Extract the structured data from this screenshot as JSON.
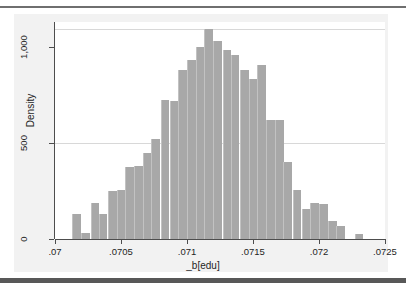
{
  "chart_data": {
    "type": "bar",
    "title": "",
    "subtitle": "",
    "xlabel": "_b[edu]",
    "ylabel": "Density",
    "grid": true,
    "legend": null,
    "xlim": [
      0.07,
      0.0725
    ],
    "ylim": [
      0,
      1130
    ],
    "xticks": [
      ".07",
      ".0705",
      ".071",
      ".0715",
      ".072",
      ".0725"
    ],
    "xtick_values": [
      0.07,
      0.0705,
      0.071,
      0.0715,
      0.072,
      0.0725
    ],
    "yticks": [
      "0",
      "500",
      "1,000"
    ],
    "ytick_values": [
      0,
      500,
      1000
    ],
    "bin_width": 6.67e-05,
    "categories": [
      "0.07013",
      "0.07020",
      "0.07027",
      "0.07033",
      "0.07040",
      "0.07047",
      "0.07053",
      "0.07060",
      "0.07067",
      "0.07073",
      "0.07080",
      "0.07087",
      "0.07093",
      "0.07100",
      "0.07107",
      "0.07113",
      "0.07120",
      "0.07127",
      "0.07133",
      "0.07140",
      "0.07147",
      "0.07153",
      "0.07160",
      "0.07167",
      "0.07173",
      "0.07180",
      "0.07187",
      "0.07193",
      "0.07200",
      "0.07207",
      "0.07213",
      "0.07220",
      "0.07227"
    ],
    "values": [
      130,
      30,
      185,
      130,
      250,
      255,
      375,
      380,
      450,
      520,
      725,
      720,
      880,
      930,
      1000,
      1095,
      1030,
      985,
      960,
      880,
      835,
      905,
      620,
      620,
      400,
      255,
      155,
      185,
      180,
      95,
      70,
      0,
      25
    ]
  },
  "axes": {
    "y_title": "Density",
    "x_title": "_b[edu]"
  }
}
